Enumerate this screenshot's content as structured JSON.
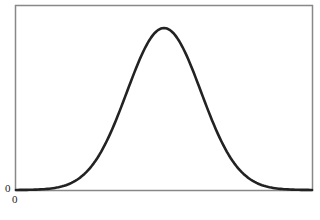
{
  "chart_data": {
    "type": "line",
    "title": "",
    "xlabel": "",
    "ylabel": "",
    "xlim": [
      -4,
      4
    ],
    "ylim": [
      0,
      0.44
    ],
    "x_tick_labels": [
      "0"
    ],
    "y_tick_labels": [
      "0"
    ],
    "grid": false,
    "legend": null,
    "series": [
      {
        "name": "density",
        "color": "#222222",
        "x": [
          -4.0,
          -3.5,
          -3.0,
          -2.5,
          -2.0,
          -1.5,
          -1.0,
          -0.5,
          0.0,
          0.5,
          1.0,
          1.5,
          2.0,
          2.5,
          3.0,
          3.5,
          4.0
        ],
        "y": [
          0.0001,
          0.0009,
          0.0044,
          0.0175,
          0.054,
          0.1295,
          0.242,
          0.3521,
          0.3989,
          0.3521,
          0.242,
          0.1295,
          0.054,
          0.0175,
          0.0044,
          0.0009,
          0.0001
        ]
      }
    ]
  },
  "labels": {
    "y_zero": "0",
    "x_zero": "0"
  }
}
